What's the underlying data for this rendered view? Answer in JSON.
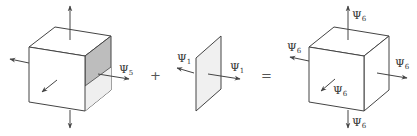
{
  "diagram": {
    "left_cube": {
      "label": "Ψ",
      "subscript": "5",
      "description": "open cube with one shaded missing face"
    },
    "plane": {
      "labels": [
        {
          "symbol": "Ψ",
          "subscript": "1"
        },
        {
          "symbol": "Ψ",
          "subscript": "1"
        }
      ]
    },
    "right_cube": {
      "label": "Ψ",
      "subscript": "6",
      "count": 6
    },
    "operators": {
      "plus": "+",
      "equals": "="
    },
    "colors": {
      "line": "#444444",
      "shade": "#bdbdbd",
      "light_shade": "#efefef",
      "plane_fill": "#f0f0f0"
    }
  }
}
